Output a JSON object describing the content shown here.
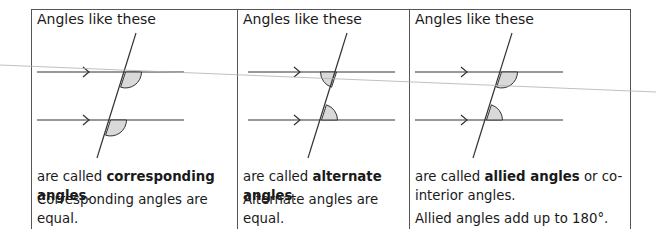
{
  "panels": [
    {
      "title": "Angles like these",
      "called_prefix": "are called ",
      "called_term": "corresponding angles",
      "called_suffix": ".",
      "rule": "Corresponding angles are equal.",
      "angle_type": "corresponding"
    },
    {
      "title": "Angles like these",
      "called_prefix": "are called ",
      "called_term": "alternate angles",
      "called_suffix": ".",
      "rule": "Alternate angles are equal.",
      "angle_type": "alternate"
    },
    {
      "title": "Angles like these",
      "called_prefix": "are called ",
      "called_term": "allied angles",
      "called_suffix": " or co-interior angles.",
      "rule": "Allied angles add up to 180°.",
      "angle_type": "allied"
    }
  ],
  "colors": {
    "line": "#333333",
    "border": "#555555",
    "angle_fill": "#d9d9d9",
    "stray_line": "#b0b0b0"
  }
}
